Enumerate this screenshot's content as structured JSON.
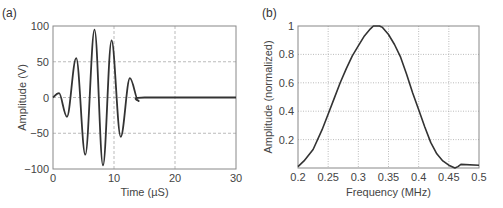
{
  "chart_data": [
    {
      "panel_label": "(a)",
      "type": "line",
      "title": "",
      "xlabel": "Time (µS)",
      "ylabel": "Amplitude (V)",
      "xlim": [
        0,
        30
      ],
      "ylim": [
        -100,
        100
      ],
      "xticks": [
        "0",
        "10",
        "20",
        "30"
      ],
      "yticks": [
        "100",
        "50",
        "0",
        "-50",
        "-100"
      ],
      "grid": "dashed",
      "series": [
        {
          "name": "waveform",
          "x": [
            0,
            1.0,
            2.3,
            3.8,
            5.3,
            6.8,
            8.2,
            9.6,
            11.1,
            12.6,
            14.0,
            15.0,
            30
          ],
          "y": [
            0,
            6,
            -27,
            55,
            -80,
            95,
            -95,
            80,
            -55,
            27,
            -5,
            0,
            0
          ]
        }
      ]
    },
    {
      "panel_label": "(b)",
      "type": "line",
      "title": "",
      "xlabel": "Frequency (MHz)",
      "ylabel": "Amplitude (normalized)",
      "xlim": [
        0.2,
        0.5
      ],
      "ylim": [
        0,
        1
      ],
      "xticks": [
        "0.2",
        "0.25",
        "0.3",
        "0.35",
        "0.4",
        "0.45",
        "0.5"
      ],
      "yticks": [
        "1",
        "0.8",
        "0.6",
        "0.4",
        "0.2"
      ],
      "grid": "dotted",
      "series": [
        {
          "name": "spectrum",
          "x": [
            0.2,
            0.21,
            0.225,
            0.24,
            0.25,
            0.26,
            0.27,
            0.28,
            0.29,
            0.3,
            0.31,
            0.32,
            0.325,
            0.335,
            0.34,
            0.35,
            0.36,
            0.37,
            0.38,
            0.39,
            0.4,
            0.41,
            0.42,
            0.43,
            0.44,
            0.45,
            0.46,
            0.465,
            0.47,
            0.5
          ],
          "y": [
            0.01,
            0.05,
            0.13,
            0.27,
            0.38,
            0.49,
            0.6,
            0.7,
            0.79,
            0.86,
            0.93,
            0.98,
            1.0,
            1.0,
            0.99,
            0.94,
            0.87,
            0.78,
            0.66,
            0.53,
            0.41,
            0.29,
            0.18,
            0.1,
            0.05,
            0.02,
            0.0,
            0.01,
            0.025,
            0.02
          ]
        }
      ]
    }
  ]
}
